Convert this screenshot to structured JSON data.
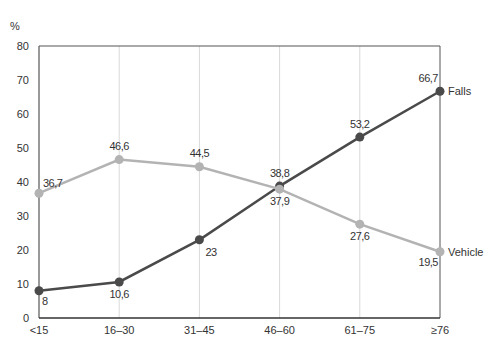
{
  "chart_data": {
    "type": "line",
    "title": "",
    "ylabel": "%",
    "xlabel": "",
    "ylim": [
      0,
      80
    ],
    "yticks": [
      0,
      10,
      20,
      30,
      40,
      50,
      60,
      70,
      80
    ],
    "categories": [
      "<15",
      "16–30",
      "31–45",
      "46–60",
      "61–75",
      "≥76"
    ],
    "grid": "vertical",
    "legend": "inline-right",
    "series": [
      {
        "name": "Falls",
        "color": "#4a4a4a",
        "values": [
          8,
          10.6,
          23,
          38.8,
          53.2,
          66.7
        ],
        "labels": [
          "8",
          "10,6",
          "23",
          "38,8",
          "53,2",
          "66,7"
        ]
      },
      {
        "name": "Vehicle",
        "color": "#b3b3b3",
        "values": [
          36.7,
          46.6,
          44.5,
          37.9,
          27.6,
          19.5
        ],
        "labels": [
          "36,7",
          "46,6",
          "44,5",
          "37,9",
          "27,6",
          "19,5"
        ]
      }
    ]
  }
}
